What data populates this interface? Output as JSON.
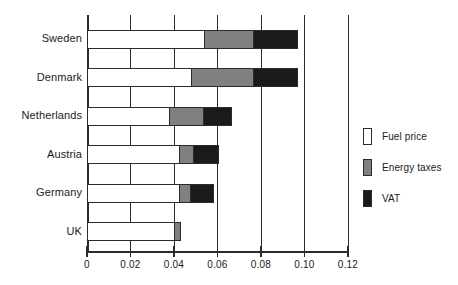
{
  "chart_data": {
    "type": "bar",
    "orientation": "horizontal",
    "stacked": true,
    "title": "",
    "subtitle": "",
    "xlabel": "",
    "ylabel": "",
    "xlim": [
      0,
      0.12
    ],
    "xticks": [
      0,
      0.02,
      0.04,
      0.06,
      0.08,
      0.1,
      0.12
    ],
    "xticklabels": [
      "0",
      "0.02",
      "0.04",
      "0.06",
      "0.08",
      "0.10",
      "0.12"
    ],
    "grid": true,
    "grid_axis": "x",
    "legend_position": "right",
    "categories": [
      "Sweden",
      "Denmark",
      "Netherlands",
      "Austria",
      "Germany",
      "UK"
    ],
    "series": [
      {
        "name": "Fuel price",
        "color": "#ffffff",
        "values": [
          0.054,
          0.048,
          0.0375,
          0.0425,
          0.0425,
          0.04
        ]
      },
      {
        "name": "Energy taxes",
        "color": "#808080",
        "values": [
          0.0225,
          0.0285,
          0.016,
          0.006,
          0.005,
          0.0025
        ]
      },
      {
        "name": "VAT",
        "color": "#1a1a1a",
        "values": [
          0.02,
          0.02,
          0.0125,
          0.0115,
          0.0105,
          0.0
        ]
      }
    ],
    "totals": [
      0.0965,
      0.0965,
      0.066,
      0.06,
      0.058,
      0.0425
    ]
  },
  "axis": {
    "tick_labels": [
      "0",
      "0.02",
      "0.04",
      "0.06",
      "0.08",
      "0.10",
      "0.12"
    ],
    "tick_values": [
      0,
      0.02,
      0.04,
      0.06,
      0.08,
      0.1,
      0.12
    ]
  },
  "categories": [
    {
      "label": "Sweden"
    },
    {
      "label": "Denmark"
    },
    {
      "label": "Netherlands"
    },
    {
      "label": "Austria"
    },
    {
      "label": "Germany"
    },
    {
      "label": "UK"
    }
  ],
  "legend": {
    "items": [
      {
        "label": "Fuel price",
        "color": "#ffffff"
      },
      {
        "label": "Energy taxes",
        "color": "#808080"
      },
      {
        "label": "VAT",
        "color": "#1a1a1a"
      }
    ]
  },
  "colors": {
    "fuel_price": "#ffffff",
    "energy_taxes": "#808080",
    "vat": "#1a1a1a",
    "ink": "#2b2b2b",
    "background": "#ffffff"
  }
}
